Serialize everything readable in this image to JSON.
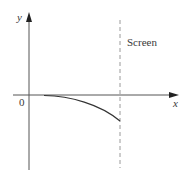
{
  "diagram": {
    "axes": {
      "x_label": "x",
      "y_label": "y",
      "origin_label": "0"
    },
    "screen": {
      "label": "Screen",
      "style": "dashed"
    },
    "curve": {
      "description": "trajectory bending downward from near origin to the screen",
      "shape": "concave-down"
    },
    "colors": {
      "axis": "#555555",
      "curve": "#333333",
      "screen": "#9a9a9a",
      "text": "#3a3a3a"
    }
  }
}
